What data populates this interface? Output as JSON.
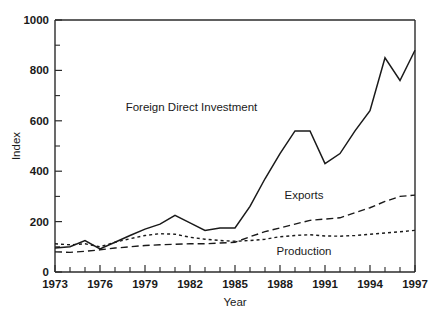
{
  "chart_data": {
    "type": "line",
    "title": "",
    "xlabel": "Year",
    "ylabel": "Index",
    "xlim": [
      1973,
      1997
    ],
    "ylim": [
      0,
      1000
    ],
    "grid": false,
    "legend_position": "inline-annotations",
    "x": [
      1973,
      1974,
      1975,
      1976,
      1977,
      1978,
      1979,
      1980,
      1981,
      1982,
      1983,
      1984,
      1985,
      1986,
      1987,
      1988,
      1989,
      1990,
      1991,
      1992,
      1993,
      1994,
      1995,
      1996,
      1997
    ],
    "x_tick_labels": [
      "1973",
      "1976",
      "1979",
      "1982",
      "1985",
      "1988",
      "1991",
      "1994",
      "1997"
    ],
    "x_tick_values": [
      1973,
      1976,
      1979,
      1982,
      1985,
      1988,
      1991,
      1994,
      1997
    ],
    "y_tick_labels": [
      "0",
      "200",
      "400",
      "600",
      "800",
      "1000"
    ],
    "y_tick_values": [
      0,
      200,
      400,
      600,
      800,
      1000
    ],
    "y_minor_tick_values": [
      100,
      300,
      500,
      700,
      900
    ],
    "series": [
      {
        "name": "Foreign Direct Investment",
        "style": "solid",
        "label_x": 1982.1,
        "label_y": 640,
        "values": [
          95,
          100,
          125,
          92,
          118,
          145,
          170,
          190,
          225,
          195,
          165,
          175,
          175,
          260,
          370,
          470,
          560,
          560,
          430,
          470,
          560,
          640,
          850,
          760,
          880
        ]
      },
      {
        "name": "Exports",
        "style": "dashed-long",
        "label_x": 1989.6,
        "label_y": 290,
        "values": [
          80,
          78,
          82,
          88,
          95,
          100,
          105,
          108,
          110,
          112,
          112,
          115,
          118,
          140,
          160,
          175,
          190,
          205,
          210,
          215,
          235,
          255,
          280,
          300,
          305
        ]
      },
      {
        "name": "Production",
        "style": "dashed-short",
        "label_x": 1989.6,
        "label_y": 68,
        "values": [
          112,
          108,
          112,
          100,
          118,
          132,
          145,
          152,
          150,
          138,
          130,
          125,
          122,
          125,
          130,
          140,
          145,
          148,
          143,
          142,
          145,
          150,
          155,
          160,
          165
        ]
      }
    ]
  },
  "axes": {
    "ylabel": "Index",
    "xlabel": "Year"
  }
}
